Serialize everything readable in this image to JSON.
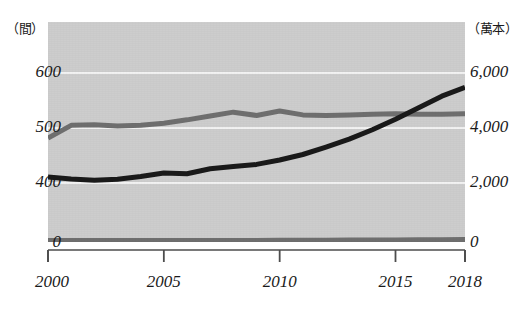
{
  "chart_data": {
    "type": "line",
    "title": "",
    "subtitle": "",
    "xlabel": "",
    "ylabel": "",
    "left_axis": {
      "unit_label": "（間）",
      "tick_labels": [
        "600",
        "500",
        "400",
        "0"
      ],
      "tick_values": [
        600,
        500,
        400,
        0
      ],
      "range": [
        0,
        650
      ]
    },
    "right_axis": {
      "unit_label": "（萬本）",
      "tick_labels": [
        "6,000",
        "4,000",
        "2,000",
        "0"
      ],
      "tick_values": [
        6000,
        4000,
        2000,
        0
      ],
      "range": [
        0,
        6500
      ]
    },
    "x": [
      2000,
      2001,
      2002,
      2003,
      2004,
      2005,
      2006,
      2007,
      2008,
      2009,
      2010,
      2011,
      2012,
      2013,
      2014,
      2015,
      2016,
      2017,
      2018
    ],
    "xtick_labels": [
      "2000",
      "2005",
      "2010",
      "2015",
      "2018"
    ],
    "xtick_values": [
      2000,
      2005,
      2010,
      2015,
      2018
    ],
    "xlim": [
      2000,
      2018
    ],
    "grid": true,
    "legend": "none",
    "series": [
      {
        "name": "gray-line",
        "axis": "left",
        "color": "#6f6f6f",
        "values": [
          480,
          503,
          504,
          502,
          503,
          507,
          513,
          520,
          527,
          521,
          529,
          522,
          521,
          522,
          523,
          524,
          523,
          523,
          524
        ]
      },
      {
        "name": "dark-line",
        "axis": "right",
        "color": "#1a1a1a",
        "values": [
          2180,
          2110,
          2060,
          2100,
          2200,
          2330,
          2300,
          2480,
          2560,
          2640,
          2800,
          3000,
          3270,
          3560,
          3900,
          4280,
          4700,
          5120,
          5440
        ]
      },
      {
        "name": "baseline-gray-line",
        "axis": "left",
        "color": "#6f6f6f",
        "values": [
          3,
          3,
          3,
          3,
          3,
          3,
          4,
          4,
          4,
          4,
          5,
          5,
          5,
          6,
          6,
          7,
          8,
          9,
          10
        ]
      }
    ],
    "colors": {
      "plot_background": "#cdcdcd",
      "gridline": "#f2f2f2",
      "page_background": "#ffffff",
      "axis": "#4d4d4d",
      "text": "#1a1a1a"
    }
  }
}
